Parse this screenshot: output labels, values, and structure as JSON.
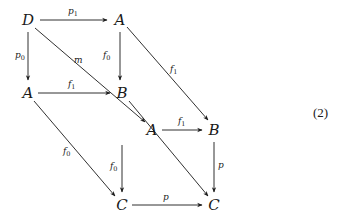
{
  "diagram": {
    "equation_number": "(2)",
    "nodes": [
      {
        "id": "D",
        "label": "D",
        "x": 28,
        "y": 20
      },
      {
        "id": "A1",
        "label": "A",
        "x": 120,
        "y": 20
      },
      {
        "id": "A2",
        "label": "A",
        "x": 28,
        "y": 93
      },
      {
        "id": "B1",
        "label": "B",
        "x": 122,
        "y": 93
      },
      {
        "id": "A3",
        "label": "A",
        "x": 152,
        "y": 130
      },
      {
        "id": "B2",
        "label": "B",
        "x": 214,
        "y": 130
      },
      {
        "id": "C1",
        "label": "C",
        "x": 122,
        "y": 205
      },
      {
        "id": "C2",
        "label": "C",
        "x": 214,
        "y": 205
      }
    ],
    "edges": [
      {
        "from": "D",
        "to": "A1",
        "label": "p",
        "sub": "1"
      },
      {
        "from": "D",
        "to": "A2",
        "label": "p",
        "sub": "0"
      },
      {
        "from": "A1",
        "to": "B1",
        "label": "f",
        "sub": "0"
      },
      {
        "from": "A1",
        "to": "B2",
        "label": "f",
        "sub": "1"
      },
      {
        "from": "A2",
        "to": "B1",
        "label": "f",
        "sub": "1"
      },
      {
        "from": "D",
        "to": "A3",
        "label": "m",
        "sub": ""
      },
      {
        "from": "A2",
        "to": "C1",
        "label": "f",
        "sub": "0"
      },
      {
        "from": "B1",
        "to": "C2",
        "label": "",
        "sub": ""
      },
      {
        "from": "A3",
        "to": "B2",
        "label": "f",
        "sub": "1"
      },
      {
        "from": "A3",
        "to": "C1",
        "label": "f",
        "sub": "0"
      },
      {
        "from": "B2",
        "to": "C2",
        "label": "p",
        "sub": ""
      },
      {
        "from": "C1",
        "to": "C2",
        "label": "p",
        "sub": ""
      }
    ]
  }
}
